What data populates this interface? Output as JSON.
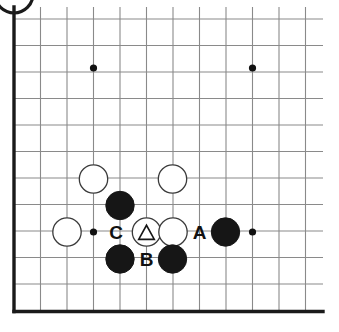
{
  "figure": {
    "kind": "go-board-diagram",
    "title": "",
    "width": 339,
    "height": 332,
    "background_color": "#ffffff"
  },
  "board": {
    "origin_x": 14,
    "origin_y": 19,
    "spacing": 26.5,
    "cols": 12,
    "rows": 12,
    "grid_right_x": 323,
    "grid_bottom_y": 311.5,
    "line_color": "#8a8a8a",
    "line_width": 1.1,
    "edge_color": "#1a1a1a",
    "edge_width": 3.4,
    "edges": [
      "left",
      "bottom"
    ],
    "star_point_radius": 3.6,
    "star_point_color": "#111111",
    "star_points": [
      {
        "x": 93.5,
        "y": 68
      },
      {
        "x": 252.5,
        "y": 68
      },
      {
        "x": 93.5,
        "y": 232
      },
      {
        "x": 252.5,
        "y": 232
      }
    ]
  },
  "stones": {
    "radius": 14.2,
    "black_fill": "#161616",
    "black_stroke": "#161616",
    "white_fill": "#ffffff",
    "white_stroke": "#3a3a3a",
    "white_stroke_width": 1.3,
    "list": [
      {
        "id": "w1",
        "color": "white",
        "x": 93.5,
        "y": 179,
        "marker": "none"
      },
      {
        "id": "w2",
        "color": "white",
        "x": 172.5,
        "y": 179,
        "marker": "none"
      },
      {
        "id": "b1",
        "color": "black",
        "x": 120,
        "y": 205.5,
        "marker": "none"
      },
      {
        "id": "w3",
        "color": "white",
        "x": 67,
        "y": 232,
        "marker": "none"
      },
      {
        "id": "w4",
        "color": "white",
        "x": 146.5,
        "y": 232,
        "marker": "triangle"
      },
      {
        "id": "w5",
        "color": "white",
        "x": 173,
        "y": 232,
        "marker": "none"
      },
      {
        "id": "b2",
        "color": "black",
        "x": 225.5,
        "y": 232,
        "marker": "none"
      },
      {
        "id": "b3",
        "color": "black",
        "x": 120,
        "y": 259,
        "marker": "none"
      },
      {
        "id": "b4",
        "color": "black",
        "x": 172.5,
        "y": 259,
        "marker": "none"
      }
    ]
  },
  "markers": {
    "triangle_stroke": "#161616",
    "triangle_stroke_width": 1.6,
    "triangle_size": 15
  },
  "point_labels": {
    "color": "#111111",
    "font_size": 19,
    "list": [
      {
        "text": "C",
        "x": 116,
        "y": 232
      },
      {
        "text": "A",
        "x": 199.5,
        "y": 232
      },
      {
        "text": "B",
        "x": 146.5,
        "y": 259
      }
    ]
  },
  "decoration": {
    "corner_arc": {
      "name": "partial-circle-arc",
      "center_x": 14,
      "center_y": -6,
      "radius": 19,
      "stroke_color": "#1a1a1a",
      "stroke_width": 3.2
    }
  }
}
